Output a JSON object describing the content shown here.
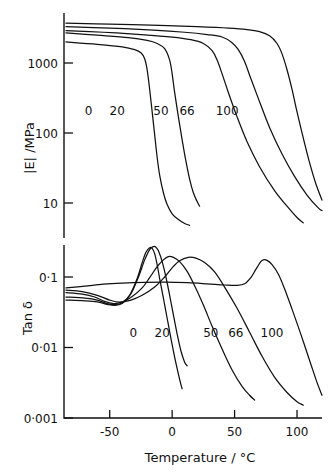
{
  "figure": {
    "background": "#ffffff",
    "ink_color": "#111111"
  },
  "chart_data": {
    "type": "line",
    "title": "",
    "subtitle": "",
    "xlabel": "Temperature / °C",
    "xlim": [
      -85,
      120
    ],
    "xticks": [
      -50,
      0,
      50,
      100
    ],
    "xtick_labels": [
      "-50",
      "0",
      "50",
      "100"
    ],
    "grid": false,
    "legend_position": "inline-curve-labels",
    "panels": [
      {
        "id": "modulus-panel",
        "ylabel": "|E| /MPa",
        "yscale": "log",
        "ylim": [
          3.0,
          6000
        ],
        "yticks": [
          1000,
          100,
          10
        ],
        "ytick_labels": [
          "1000",
          "100",
          "10"
        ],
        "series": [
          {
            "name": "0",
            "label": "0",
            "label_x": -67,
            "label_y": 210,
            "points": [
              [
                -85,
                2000
              ],
              [
                -60,
                1850
              ],
              [
                -40,
                1700
              ],
              [
                -30,
                1550
              ],
              [
                -25,
                1400
              ],
              [
                -22,
                1150
              ],
              [
                -20,
                800
              ],
              [
                -18,
                420
              ],
              [
                -16,
                200
              ],
              [
                -14,
                95
              ],
              [
                -12,
                45
              ],
              [
                -10,
                25
              ],
              [
                -7,
                14
              ],
              [
                -4,
                9.5
              ],
              [
                0,
                7.0
              ],
              [
                5,
                5.8
              ],
              [
                10,
                5.1
              ],
              [
                14,
                4.8
              ]
            ]
          },
          {
            "name": "20",
            "label": "20",
            "label_x": -44,
            "label_y": 210,
            "points": [
              [
                -85,
                2700
              ],
              [
                -60,
                2500
              ],
              [
                -35,
                2300
              ],
              [
                -20,
                2100
              ],
              [
                -12,
                1900
              ],
              [
                -6,
                1600
              ],
              [
                -2,
                1100
              ],
              [
                0,
                700
              ],
              [
                2,
                380
              ],
              [
                5,
                170
              ],
              [
                8,
                80
              ],
              [
                11,
                40
              ],
              [
                14,
                22
              ],
              [
                17,
                14
              ],
              [
                20,
                10.5
              ],
              [
                22,
                9.0
              ]
            ]
          },
          {
            "name": "50",
            "label": "50",
            "label_x": -9,
            "label_y": 210,
            "points": [
              [
                -85,
                2900
              ],
              [
                -55,
                2750
              ],
              [
                -25,
                2550
              ],
              [
                0,
                2350
              ],
              [
                15,
                2150
              ],
              [
                25,
                1900
              ],
              [
                32,
                1500
              ],
              [
                36,
                1100
              ],
              [
                40,
                700
              ],
              [
                45,
                380
              ],
              [
                52,
                170
              ],
              [
                60,
                75
              ],
              [
                70,
                33
              ],
              [
                82,
                15
              ],
              [
                92,
                9
              ],
              [
                100,
                6.2
              ],
              [
                105,
                5.2
              ]
            ]
          },
          {
            "name": "66",
            "label": "66",
            "label_x": 12,
            "label_y": 210,
            "points": [
              [
                -85,
                3300
              ],
              [
                -50,
                3150
              ],
              [
                -15,
                2950
              ],
              [
                10,
                2750
              ],
              [
                28,
                2550
              ],
              [
                40,
                2350
              ],
              [
                48,
                1950
              ],
              [
                53,
                1550
              ],
              [
                58,
                1050
              ],
              [
                63,
                600
              ],
              [
                70,
                280
              ],
              [
                78,
                120
              ],
              [
                88,
                50
              ],
              [
                98,
                24
              ],
              [
                108,
                13
              ],
              [
                117,
                8.5
              ],
              [
                120,
                7.8
              ]
            ]
          },
          {
            "name": "100",
            "label": "100",
            "label_x": 44,
            "label_y": 210,
            "points": [
              [
                -85,
                3700
              ],
              [
                -50,
                3600
              ],
              [
                -10,
                3450
              ],
              [
                20,
                3300
              ],
              [
                45,
                3150
              ],
              [
                60,
                3000
              ],
              [
                70,
                2800
              ],
              [
                78,
                2450
              ],
              [
                84,
                1900
              ],
              [
                88,
                1350
              ],
              [
                92,
                800
              ],
              [
                96,
                420
              ],
              [
                100,
                200
              ],
              [
                105,
                85
              ],
              [
                110,
                38
              ],
              [
                115,
                19
              ],
              [
                120,
                11
              ]
            ]
          }
        ]
      },
      {
        "id": "tandelta-panel",
        "ylabel": "Tan δ",
        "yscale": "log",
        "ylim": [
          0.001,
          0.55
        ],
        "yticks": [
          0.1,
          0.01,
          0.001
        ],
        "ytick_labels": [
          "0·1",
          "0·01",
          "0·001"
        ],
        "series": [
          {
            "name": "0",
            "label": "0",
            "label_x": -31,
            "label_y": 0.0165,
            "peak_x": -18,
            "peak_y": 0.26,
            "points": [
              [
                -85,
                0.047
              ],
              [
                -70,
                0.046
              ],
              [
                -60,
                0.0445
              ],
              [
                -52,
                0.041
              ],
              [
                -46,
                0.0395
              ],
              [
                -40,
                0.042
              ],
              [
                -34,
                0.055
              ],
              [
                -28,
                0.095
              ],
              [
                -24,
                0.16
              ],
              [
                -21,
                0.225
              ],
              [
                -18,
                0.26
              ],
              [
                -16,
                0.255
              ],
              [
                -14,
                0.215
              ],
              [
                -12,
                0.15
              ],
              [
                -10,
                0.095
              ],
              [
                -7,
                0.05
              ],
              [
                -4,
                0.026
              ],
              [
                -1,
                0.0135
              ],
              [
                2,
                0.0073
              ],
              [
                5,
                0.0042
              ],
              [
                7,
                0.003
              ],
              [
                8,
                0.0026
              ]
            ]
          },
          {
            "name": "20",
            "label": "20",
            "label_x": -8,
            "label_y": 0.0165,
            "peak_x": -15,
            "peak_y": 0.27,
            "points": [
              [
                -85,
                0.052
              ],
              [
                -70,
                0.05
              ],
              [
                -60,
                0.047
              ],
              [
                -52,
                0.042
              ],
              [
                -46,
                0.0405
              ],
              [
                -40,
                0.043
              ],
              [
                -33,
                0.058
              ],
              [
                -27,
                0.1
              ],
              [
                -22,
                0.175
              ],
              [
                -18,
                0.245
              ],
              [
                -15,
                0.27
              ],
              [
                -13,
                0.265
              ],
              [
                -11,
                0.235
              ],
              [
                -8,
                0.165
              ],
              [
                -5,
                0.1
              ],
              [
                -2,
                0.055
              ],
              [
                1,
                0.029
              ],
              [
                4,
                0.0155
              ],
              [
                7,
                0.009
              ],
              [
                10,
                0.0062
              ],
              [
                12,
                0.0055
              ]
            ]
          },
          {
            "name": "50",
            "label": "50",
            "label_x": 31,
            "label_y": 0.0165,
            "peak_x": -3,
            "peak_y": 0.195,
            "points": [
              [
                -85,
                0.06
              ],
              [
                -72,
                0.057
              ],
              [
                -62,
                0.052
              ],
              [
                -54,
                0.045
              ],
              [
                -47,
                0.042
              ],
              [
                -40,
                0.044
              ],
              [
                -32,
                0.053
              ],
              [
                -24,
                0.07
              ],
              [
                -18,
                0.098
              ],
              [
                -12,
                0.14
              ],
              [
                -7,
                0.175
              ],
              [
                -3,
                0.195
              ],
              [
                1,
                0.19
              ],
              [
                6,
                0.165
              ],
              [
                12,
                0.12
              ],
              [
                18,
                0.075
              ],
              [
                25,
                0.04
              ],
              [
                32,
                0.02
              ],
              [
                40,
                0.0095
              ],
              [
                48,
                0.0048
              ],
              [
                56,
                0.0028
              ],
              [
                62,
                0.0021
              ],
              [
                66,
                0.0018
              ]
            ]
          },
          {
            "name": "66",
            "label": "66",
            "label_x": 51,
            "label_y": 0.0165,
            "peak_x": 13,
            "peak_y": 0.19,
            "points": [
              [
                -85,
                0.065
              ],
              [
                -72,
                0.062
              ],
              [
                -60,
                0.055
              ],
              [
                -50,
                0.047
              ],
              [
                -42,
                0.044
              ],
              [
                -33,
                0.047
              ],
              [
                -24,
                0.055
              ],
              [
                -14,
                0.072
              ],
              [
                -6,
                0.1
              ],
              [
                0,
                0.135
              ],
              [
                6,
                0.17
              ],
              [
                13,
                0.19
              ],
              [
                19,
                0.185
              ],
              [
                26,
                0.16
              ],
              [
                34,
                0.118
              ],
              [
                42,
                0.072
              ],
              [
                52,
                0.036
              ],
              [
                62,
                0.0165
              ],
              [
                72,
                0.0075
              ],
              [
                82,
                0.0038
              ],
              [
                92,
                0.0023
              ],
              [
                100,
                0.0017
              ],
              [
                105,
                0.00152
              ]
            ]
          },
          {
            "name": "100",
            "label": "100",
            "label_x": 80,
            "label_y": 0.0165,
            "peak_x": 73,
            "peak_y": 0.175,
            "points": [
              [
                -85,
                0.07
              ],
              [
                -70,
                0.074
              ],
              [
                -55,
                0.079
              ],
              [
                -40,
                0.082
              ],
              [
                -22,
                0.084
              ],
              [
                -5,
                0.0845
              ],
              [
                12,
                0.083
              ],
              [
                28,
                0.08
              ],
              [
                42,
                0.077
              ],
              [
                52,
                0.076
              ],
              [
                58,
                0.08
              ],
              [
                63,
                0.098
              ],
              [
                67,
                0.128
              ],
              [
                71,
                0.165
              ],
              [
                73,
                0.175
              ],
              [
                76,
                0.172
              ],
              [
                80,
                0.15
              ],
              [
                85,
                0.11
              ],
              [
                90,
                0.068
              ],
              [
                96,
                0.035
              ],
              [
                103,
                0.0155
              ],
              [
                110,
                0.0066
              ],
              [
                116,
                0.0032
              ],
              [
                120,
                0.0021
              ]
            ]
          }
        ]
      }
    ]
  }
}
